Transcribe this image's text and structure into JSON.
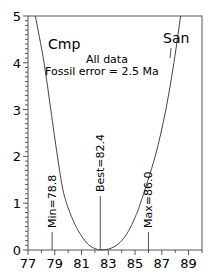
{
  "chart_data": {
    "type": "line",
    "title": "",
    "xlabel": "",
    "ylabel": "",
    "xlim": [
      77,
      90
    ],
    "ylim": [
      0,
      5
    ],
    "x_ticks": [
      "77",
      "79",
      "81",
      "83",
      "85",
      "87",
      "89"
    ],
    "y_ticks": [
      "0",
      "1",
      "2",
      "3",
      "4",
      "5"
    ],
    "grid": false,
    "series": [
      {
        "name": "misfit curve",
        "x": [
          77.55,
          78.2,
          78.7,
          79.2,
          79.6,
          80.0,
          80.5,
          81.0,
          81.5,
          82.0,
          82.4,
          83.0,
          83.5,
          84.0,
          84.5,
          85.0,
          85.4,
          86.5,
          87.3,
          87.9,
          88.4
        ],
        "y": [
          5.0,
          4.0,
          3.0,
          2.0,
          1.3,
          0.9,
          0.55,
          0.3,
          0.12,
          0.03,
          0.0,
          0.02,
          0.08,
          0.2,
          0.4,
          0.7,
          1.0,
          2.0,
          3.0,
          4.0,
          5.0
        ]
      }
    ],
    "annotations": {
      "left_period": "Cmp",
      "right_period": "San",
      "subtitle_line1": "All data",
      "subtitle_line2": "Fossil error = 2.5 Ma",
      "markers": [
        {
          "label": "Min=78.8",
          "x": 78.8
        },
        {
          "label": "Best=82.4",
          "x": 82.4
        },
        {
          "label": "Max=86.0",
          "x": 86.0
        }
      ]
    }
  }
}
